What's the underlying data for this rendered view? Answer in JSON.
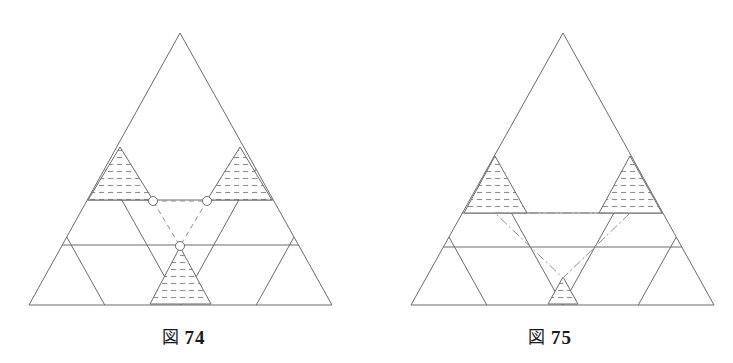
{
  "page": {
    "background_color": "#ffffff",
    "width": 733,
    "height": 363
  },
  "style": {
    "line_color": "#6b6b6b",
    "hatch_color": "#8a8a8a",
    "dash_color": "#8f8f8f",
    "caption_color": "#1a1a1a",
    "line_width": 1
  },
  "figures": [
    {
      "id": "fig-74",
      "caption_kanji": "図",
      "caption_number": "74",
      "caption_full": "図 74",
      "geometry": {
        "apex": [
          180,
          33
        ],
        "bottom_left": [
          29,
          305
        ],
        "bottom_right": [
          332,
          305
        ],
        "rows": 4,
        "grid_type": "triangular-lattice",
        "horizontal_lines_y": [
          200,
          245
        ],
        "marker_points": [
          [
            153,
            201
          ],
          [
            207,
            201
          ],
          [
            180,
            246
          ]
        ],
        "marker_shape": "open-circle",
        "marker_radius": 4.5
      },
      "hatched_regions": [
        {
          "name": "upper-left-hatch",
          "apex": [
            120,
            147
          ],
          "left": [
            88,
            200
          ],
          "right": [
            153,
            200
          ]
        },
        {
          "name": "upper-right-hatch",
          "apex": [
            240,
            147
          ],
          "left": [
            207,
            200
          ],
          "right": [
            272,
            200
          ]
        },
        {
          "name": "bottom-center-hatch",
          "apex": [
            180,
            247
          ],
          "left": [
            150,
            304
          ],
          "right": [
            211,
            304
          ]
        }
      ],
      "dashed_triangle": {
        "name": "inverted-dashed-triangle",
        "style": "dashed",
        "vertices": [
          [
            153,
            201
          ],
          [
            207,
            201
          ],
          [
            180,
            246
          ]
        ]
      }
    },
    {
      "id": "fig-75",
      "caption_kanji": "図",
      "caption_number": "75",
      "caption_full": "図 75",
      "geometry": {
        "apex": [
          563,
          33
        ],
        "bottom_left": [
          411,
          305
        ],
        "bottom_right": [
          714,
          305
        ],
        "rows": 4,
        "grid_type": "triangular-lattice",
        "horizontal_lines_y": [
          213,
          247
        ],
        "marker_points": [],
        "marker_shape": "none",
        "marker_radius": 0
      },
      "hatched_regions": [
        {
          "name": "left-hatch",
          "apex": [
            495,
            156
          ],
          "left": [
            464,
            213
          ],
          "right": [
            527,
            213
          ]
        },
        {
          "name": "right-hatch",
          "apex": [
            630,
            156
          ],
          "left": [
            599,
            213
          ],
          "right": [
            662,
            213
          ]
        },
        {
          "name": "bottom-center-hatch",
          "apex": [
            563,
            277
          ],
          "left": [
            548,
            304
          ],
          "right": [
            578,
            304
          ]
        }
      ],
      "dashed_triangle": {
        "name": "inverted-dashdot-triangle",
        "style": "dash-dot",
        "vertices": [
          [
            495,
            213
          ],
          [
            630,
            213
          ],
          [
            563,
            278
          ]
        ]
      }
    }
  ]
}
